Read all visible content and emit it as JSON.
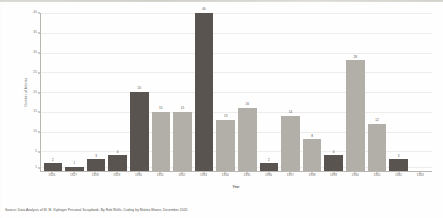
{
  "chart_data": {
    "type": "bar",
    "title": "",
    "xlabel": "Year",
    "ylabel": "Number of Articles",
    "ylim": [
      0,
      40
    ],
    "grid": true,
    "legend": "none",
    "categories": [
      "1926",
      "1927",
      "1928",
      "1929",
      "1930",
      "1931",
      "1932",
      "1933",
      "1934",
      "1935",
      "1936",
      "1937",
      "1938",
      "1939",
      "1940",
      "1941",
      "1942",
      "1943"
    ],
    "values": [
      2,
      1,
      3,
      4,
      20,
      15,
      15,
      40,
      13,
      16,
      2,
      14,
      8,
      4,
      28,
      12,
      3,
      0
    ],
    "bar_labels": [
      "2",
      "1",
      "3",
      "4",
      "20",
      "15",
      "15",
      "40",
      "13",
      "16",
      "2",
      "14",
      "8",
      "4",
      "28",
      "12",
      "3",
      ""
    ],
    "yticks": [
      "40",
      "35",
      "30",
      "25",
      "20",
      "15",
      "10",
      "5",
      "1"
    ],
    "ytick_values": [
      40,
      35,
      30,
      25,
      20,
      15,
      10,
      5,
      1
    ],
    "colors": {
      "dark_bar": "#595450",
      "light_bar": "#b2aea8",
      "axis": "#b9b6b0",
      "text": "#56524d",
      "background": "#fefefe"
    },
    "bar_color_pattern": [
      "dark",
      "dark",
      "dark",
      "dark",
      "dark",
      "light",
      "light",
      "dark",
      "light",
      "light",
      "dark",
      "light",
      "light",
      "dark",
      "light",
      "light",
      "dark",
      "dark"
    ]
  },
  "source": {
    "note": "Source: Data Analysis of W. M. Kiplinger Personal Scrapbook. By Rob Wells, Coding by Mattea Moore, December 2020"
  }
}
